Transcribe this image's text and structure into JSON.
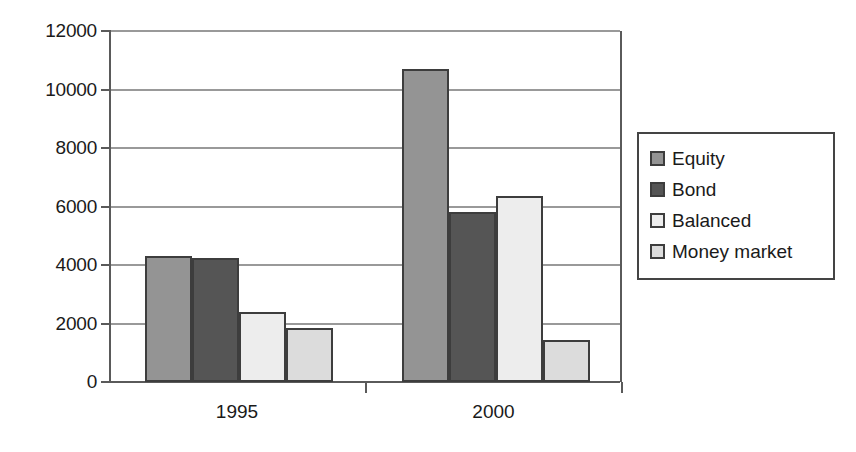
{
  "chart_data": {
    "type": "bar",
    "title": "",
    "subtitle": "",
    "xlabel": "",
    "ylabel": "",
    "categories": [
      "1995",
      "2000"
    ],
    "series": [
      {
        "name": "Equity",
        "color": "#949494",
        "values": [
          4300,
          10700
        ]
      },
      {
        "name": "Bond",
        "color": "#555555",
        "values": [
          4250,
          5800
        ]
      },
      {
        "name": "Balanced",
        "color": "#ededed",
        "values": [
          2400,
          6350
        ]
      },
      {
        "name": "Money market",
        "color": "#dcdcdc",
        "values": [
          1850,
          1450
        ]
      }
    ],
    "ylim": [
      0,
      12000
    ],
    "ytick_labels": [
      "0",
      "2000",
      "4000",
      "6000",
      "8000",
      "10000",
      "12000"
    ],
    "ytick_values": [
      0,
      2000,
      4000,
      6000,
      8000,
      10000,
      12000
    ],
    "grid": true,
    "grid_axis": "y",
    "legend_position": "right",
    "bar_border_color": "#3d3d3d",
    "axis_color": "#5a5a5a",
    "gridline_color": "#999999",
    "background_color": "#ffffff"
  }
}
